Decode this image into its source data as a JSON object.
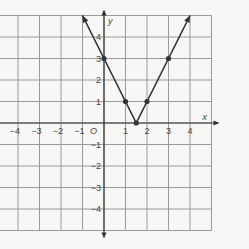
{
  "chart_data": {
    "type": "line",
    "title": "",
    "xlabel": "x",
    "ylabel": "y",
    "origin_label": "O",
    "xlim": [
      -5,
      5
    ],
    "ylim": [
      -5,
      5
    ],
    "grid": true,
    "x_ticks": [
      "-4",
      "-3",
      "-2",
      "-1",
      "1",
      "2",
      "3",
      "4"
    ],
    "y_ticks": [
      "4",
      "3",
      "2",
      "1",
      "-1",
      "-2",
      "-3",
      "-4"
    ],
    "function": "y = 2|x - 1.5|",
    "points": [
      {
        "x": 0,
        "y": 3
      },
      {
        "x": 1,
        "y": 1
      },
      {
        "x": 1.5,
        "y": 0
      },
      {
        "x": 2,
        "y": 1
      },
      {
        "x": 3,
        "y": 3
      }
    ],
    "arrows": [
      "upper-left",
      "upper-right"
    ]
  },
  "colors": {
    "grid": "#9a9a9a",
    "line": "#333333",
    "background": "#f7f7f5"
  }
}
